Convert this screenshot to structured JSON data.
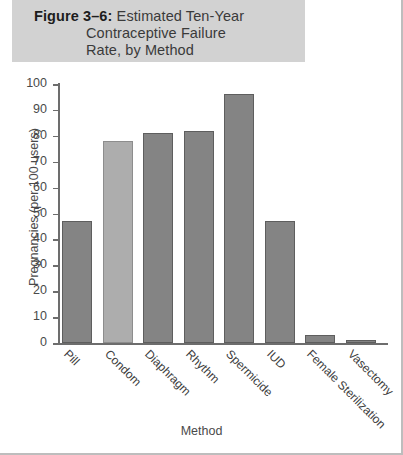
{
  "figure": {
    "number": "Figure 3–6:",
    "title_line1": "Estimated Ten-Year",
    "title_line2": "Contraceptive Failure",
    "title_line3": "Rate, by Method",
    "band_color": "#d2d2d2"
  },
  "chart_data": {
    "type": "bar",
    "title": "Figure 3–6: Estimated Ten-Year Contraceptive Failure Rate, by Method",
    "xlabel": "Method",
    "ylabel": "Pregnancies (per 100 users)",
    "categories": [
      "Pill",
      "Condom",
      "Diaphragm",
      "Rhythm",
      "Spermicide",
      "IUD",
      "Female Sterilization",
      "Vasectomy"
    ],
    "values": [
      47,
      78,
      81,
      82,
      96,
      47,
      3,
      1
    ],
    "ylim": [
      0,
      100
    ],
    "yticks": [
      0,
      10,
      20,
      30,
      40,
      50,
      60,
      70,
      80,
      90,
      100
    ],
    "ytick_labels": [
      "0",
      "10",
      "20",
      "30",
      "40",
      "50",
      "60",
      "70",
      "80",
      "90",
      "100"
    ],
    "grid": false,
    "legend": false,
    "bar_colors": [
      "#848484",
      "#adadad",
      "#848484",
      "#848484",
      "#848484",
      "#848484",
      "#848484",
      "#848484"
    ]
  }
}
